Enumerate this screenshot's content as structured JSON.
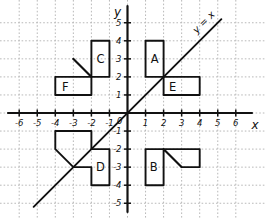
{
  "figure": {
    "background": "#ffffff",
    "ink_color": "#111111",
    "grid_color": "#b9b9b9"
  },
  "axes": {
    "x_axis_label": "x",
    "y_axis_label": "y",
    "origin_label": "0",
    "x_ticks": [
      "-6",
      "-5",
      "-4",
      "-3",
      "-2",
      "-1",
      "1",
      "2",
      "3",
      "4",
      "5",
      "6"
    ],
    "x_tick_values": [
      -6,
      -5,
      -4,
      -3,
      -2,
      -1,
      1,
      2,
      3,
      4,
      5,
      6
    ],
    "y_ticks": [
      "5",
      "4",
      "3",
      "2",
      "1",
      "-1",
      "-2",
      "-3",
      "-4",
      "-5"
    ],
    "y_tick_values": [
      5,
      4,
      3,
      2,
      1,
      -1,
      -2,
      -3,
      -4,
      -5
    ],
    "xlim": [
      -6.8,
      6.8
    ],
    "ylim": [
      -5.4,
      5.4
    ],
    "grid": true,
    "grid_style": "dotted"
  },
  "line": {
    "label": "y = x",
    "equation_slope": 1,
    "equation_intercept": 0,
    "from": [
      -5.2,
      -5.2
    ],
    "to": [
      5.2,
      5.2
    ],
    "label_rotation_deg": -45
  },
  "shapes": [
    {
      "id": "A",
      "label": "A",
      "label_at": [
        1.5,
        3.0
      ],
      "quadrant": "upper-right",
      "outline": [
        [
          1,
          2
        ],
        [
          1,
          4
        ],
        [
          2,
          4
        ],
        [
          2,
          2
        ]
      ],
      "type": "rectangle",
      "bounds": {
        "x": [
          1,
          2
        ],
        "y": [
          2,
          4
        ]
      }
    },
    {
      "id": "B",
      "label": "B",
      "label_at": [
        1.45,
        -3.0
      ],
      "quadrant": "lower-right",
      "outline": [
        [
          1,
          -4
        ],
        [
          1,
          -2
        ],
        [
          2,
          -2
        ],
        [
          3,
          -3
        ],
        [
          4,
          -3
        ],
        [
          4,
          -2
        ],
        [
          3,
          -2
        ],
        [
          2,
          -2
        ],
        [
          2,
          -4
        ]
      ],
      "type": "composite-with-diagonal",
      "diagonal": [
        [
          2,
          -2
        ],
        [
          3,
          -3
        ]
      ],
      "bounds": {
        "x": [
          1,
          4
        ],
        "y": [
          -4,
          -2
        ]
      }
    },
    {
      "id": "C",
      "label": "C",
      "label_at": [
        -1.5,
        3.0
      ],
      "quadrant": "upper-left",
      "outline": [
        [
          -2,
          4
        ],
        [
          -1,
          4
        ],
        [
          -1,
          2
        ],
        [
          -2,
          2
        ],
        [
          -3,
          3
        ],
        [
          -2,
          2
        ]
      ],
      "type": "composite-with-diagonal",
      "diagonal": [
        [
          -3,
          3
        ],
        [
          -2,
          2
        ]
      ],
      "bounds": {
        "x": [
          -3,
          -1
        ],
        "y": [
          2,
          4
        ]
      }
    },
    {
      "id": "D",
      "label": "D",
      "label_at": [
        -1.5,
        -3.0
      ],
      "quadrant": "lower-left",
      "outline": [
        [
          -4,
          -1
        ],
        [
          -2,
          -1
        ],
        [
          -2,
          -2
        ],
        [
          -1,
          -2
        ],
        [
          -1,
          -4
        ],
        [
          -2,
          -4
        ],
        [
          -2,
          -3
        ],
        [
          -3,
          -3
        ],
        [
          -4,
          -2
        ]
      ],
      "type": "composite",
      "bounds": {
        "x": [
          -4,
          -1
        ],
        "y": [
          -4,
          -1
        ]
      }
    },
    {
      "id": "E",
      "label": "E",
      "label_at": [
        2.5,
        1.45
      ],
      "quadrant": "upper-right",
      "outline": [
        [
          2,
          1
        ],
        [
          2,
          2
        ],
        [
          4,
          2
        ],
        [
          4,
          1
        ]
      ],
      "type": "rectangle",
      "bounds": {
        "x": [
          2,
          4
        ],
        "y": [
          1,
          2
        ]
      }
    },
    {
      "id": "F",
      "label": "F",
      "label_at": [
        -3.45,
        1.45
      ],
      "quadrant": "upper-left",
      "outline": [
        [
          -4,
          1
        ],
        [
          -4,
          2
        ],
        [
          -3,
          2
        ],
        [
          -2,
          2
        ],
        [
          -2,
          1
        ]
      ],
      "type": "rectangle",
      "bounds": {
        "x": [
          -4,
          -2
        ],
        "y": [
          1,
          2
        ]
      }
    }
  ]
}
